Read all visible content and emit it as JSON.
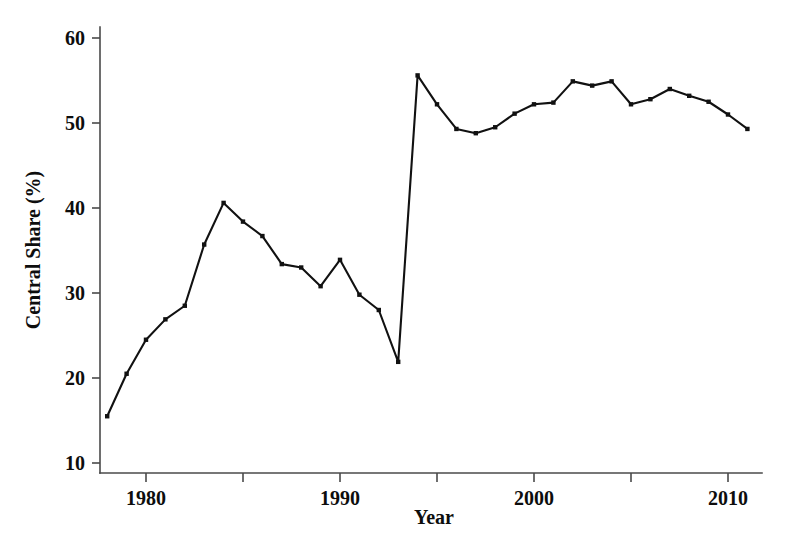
{
  "chart_data": {
    "type": "line",
    "title": "",
    "xlabel": "Year",
    "ylabel": "Central Share (%)",
    "xlim": [
      1977,
      2012
    ],
    "ylim": [
      8,
      62
    ],
    "xticks": [
      1980,
      1990,
      2000,
      2010
    ],
    "xtick_labels": [
      "1980",
      "1990",
      "2000",
      "2010"
    ],
    "xminor_ticks": [
      1977.5,
      1985,
      1995,
      2005
    ],
    "yticks": [
      10,
      20,
      30,
      40,
      50,
      60
    ],
    "ytick_labels": [
      "10",
      "20",
      "30",
      "40",
      "50",
      "60"
    ],
    "grid": false,
    "legend": false,
    "legend_position": "none",
    "marker": "square",
    "line_color": "#111111",
    "axis_color": "#4a4a4a",
    "series": [
      {
        "name": "Central Share",
        "x": [
          1978,
          1979,
          1980,
          1981,
          1982,
          1983,
          1984,
          1985,
          1986,
          1987,
          1988,
          1989,
          1990,
          1991,
          1992,
          1993,
          1994,
          1995,
          1996,
          1997,
          1998,
          1999,
          2000,
          2001,
          2002,
          2003,
          2004,
          2005,
          2006,
          2007,
          2008,
          2009,
          2010,
          2011
        ],
        "values": [
          15.5,
          20.5,
          24.5,
          26.9,
          28.5,
          35.7,
          40.6,
          38.4,
          36.7,
          33.4,
          33.0,
          30.8,
          33.9,
          29.8,
          28.0,
          21.9,
          55.6,
          52.2,
          49.3,
          48.8,
          49.5,
          51.1,
          52.2,
          52.4,
          54.9,
          54.4,
          54.9,
          52.2,
          52.8,
          54.0,
          53.2,
          52.5,
          51.0,
          49.3
        ]
      }
    ]
  },
  "axes": {
    "x_title": "Year",
    "y_title": "Central Share (%)"
  }
}
